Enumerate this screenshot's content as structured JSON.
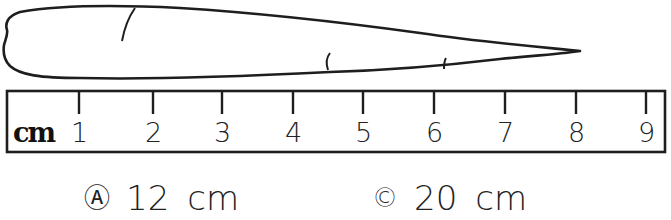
{
  "figure": {
    "object": "carrot",
    "ruler": {
      "unit": "cm",
      "tick_labels": [
        "1",
        "2",
        "3",
        "4",
        "5",
        "6",
        "7",
        "8",
        "9"
      ],
      "tick_x": [
        79,
        153,
        222,
        293,
        363,
        434,
        505,
        576,
        646
      ]
    }
  },
  "choices": [
    {
      "marker": "Ⓐ",
      "value": "12",
      "unit": "cm"
    },
    {
      "marker": "©",
      "value": "20",
      "unit": "cm"
    }
  ]
}
